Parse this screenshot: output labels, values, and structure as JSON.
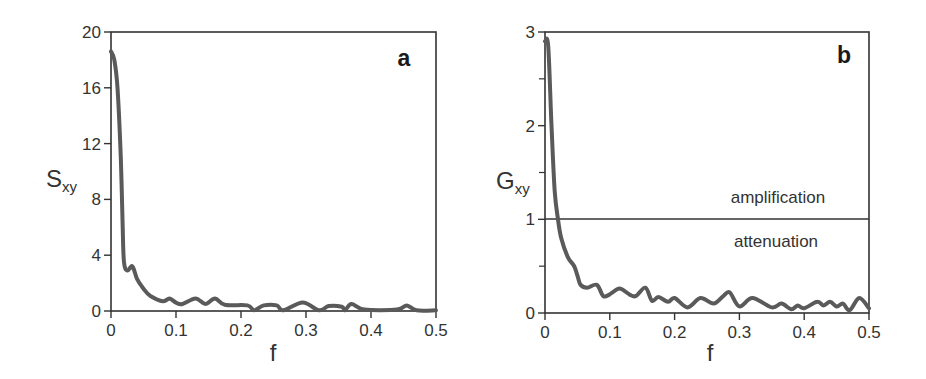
{
  "chart_data": [
    {
      "type": "line",
      "panel": "a",
      "title": "",
      "xlabel": "f",
      "ylabel": "S",
      "ylabel_subscript": "xy",
      "xlim": [
        0,
        0.5
      ],
      "ylim": [
        0,
        20
      ],
      "x_ticks": [
        0,
        0.1,
        0.2,
        0.3,
        0.4,
        0.5
      ],
      "x_tick_labels": [
        "0",
        "0.1",
        "0.2",
        "0.3",
        "0.4",
        "0.5"
      ],
      "y_ticks": [
        0,
        4,
        8,
        12,
        16,
        20
      ],
      "y_tick_labels": [
        "0",
        "4",
        "8",
        "12",
        "16",
        "20"
      ],
      "grid": false,
      "series": [
        {
          "name": "S_xy",
          "color": "#5a5a5a",
          "x": [
            0,
            0.005,
            0.01,
            0.015,
            0.018,
            0.02,
            0.025,
            0.033,
            0.04,
            0.05,
            0.06,
            0.08,
            0.09,
            0.1,
            0.11,
            0.13,
            0.145,
            0.16,
            0.175,
            0.21,
            0.22,
            0.235,
            0.255,
            0.265,
            0.295,
            0.32,
            0.335,
            0.355,
            0.36,
            0.37,
            0.39,
            0.44,
            0.455,
            0.47,
            0.5
          ],
          "values": [
            18.6,
            18.0,
            16.0,
            11.0,
            6.0,
            3.5,
            2.9,
            3.2,
            2.3,
            1.6,
            1.1,
            0.7,
            0.9,
            0.6,
            0.5,
            0.9,
            0.5,
            0.9,
            0.45,
            0.4,
            0.05,
            0.4,
            0.4,
            0.05,
            0.6,
            0.05,
            0.35,
            0.3,
            0.05,
            0.5,
            0.1,
            0.1,
            0.4,
            0.05,
            0.05
          ]
        }
      ]
    },
    {
      "type": "line",
      "panel": "b",
      "title": "",
      "xlabel": "f",
      "ylabel": "G",
      "ylabel_subscript": "xy",
      "xlim": [
        0,
        0.5
      ],
      "ylim": [
        0,
        3
      ],
      "x_ticks": [
        0,
        0.1,
        0.2,
        0.3,
        0.4,
        0.5
      ],
      "x_tick_labels": [
        "0",
        "0.1",
        "0.2",
        "0.3",
        "0.4",
        "0.5"
      ],
      "y_ticks": [
        0,
        1,
        2,
        3
      ],
      "y_tick_labels": [
        "0",
        "1",
        "2",
        "3"
      ],
      "y_minor_ticks": [
        0.5,
        1.5,
        2.5
      ],
      "grid": false,
      "reference_line": {
        "y": 1,
        "label_above": "amplification",
        "label_below": "attenuation"
      },
      "series": [
        {
          "name": "G_xy",
          "color": "#5a5a5a",
          "x": [
            0,
            0.005,
            0.01,
            0.015,
            0.02,
            0.025,
            0.035,
            0.045,
            0.05,
            0.055,
            0.065,
            0.08,
            0.09,
            0.1,
            0.115,
            0.13,
            0.14,
            0.155,
            0.165,
            0.175,
            0.19,
            0.2,
            0.22,
            0.24,
            0.26,
            0.275,
            0.285,
            0.3,
            0.32,
            0.35,
            0.365,
            0.38,
            0.39,
            0.4,
            0.42,
            0.43,
            0.44,
            0.45,
            0.46,
            0.47,
            0.485,
            0.5
          ],
          "values": [
            2.9,
            2.85,
            2.0,
            1.3,
            1.0,
            0.8,
            0.6,
            0.5,
            0.4,
            0.3,
            0.27,
            0.3,
            0.18,
            0.2,
            0.26,
            0.2,
            0.18,
            0.27,
            0.13,
            0.17,
            0.12,
            0.16,
            0.06,
            0.16,
            0.1,
            0.18,
            0.22,
            0.07,
            0.16,
            0.06,
            0.1,
            0.04,
            0.08,
            0.05,
            0.12,
            0.08,
            0.12,
            0.07,
            0.1,
            0.03,
            0.16,
            0.05
          ]
        }
      ]
    }
  ],
  "panels": {
    "a": {
      "letter": "a",
      "ylabel": "S",
      "ylabel_sub": "xy",
      "xlabel": "f"
    },
    "b": {
      "letter": "b",
      "ylabel": "G",
      "ylabel_sub": "xy",
      "xlabel": "f",
      "label_above": "amplification",
      "label_below": "attenuation"
    }
  },
  "style": {
    "curve_color": "#5a5a5a",
    "axis_color": "#333333"
  }
}
